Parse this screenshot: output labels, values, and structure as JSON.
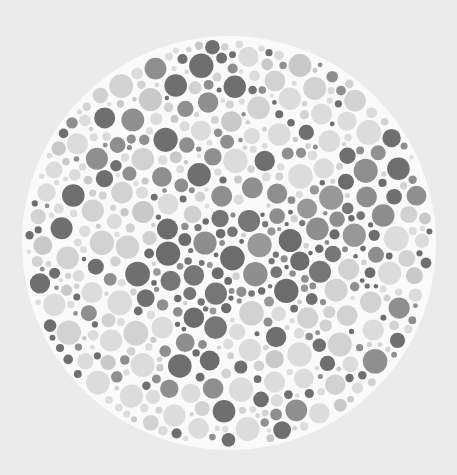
{
  "plate": {
    "title": "Color vision test plate",
    "hidden_figure": "animal silhouette",
    "background_color": "#ebebeb",
    "disc_color": "#fafafa",
    "center": [
      229,
      243
    ],
    "radius": 204,
    "seed": 20240611,
    "dot_count_target": 1400,
    "min_radius": 2.2,
    "max_radius": 12.5,
    "gap": 1.4,
    "field_palette": [
      "#dcdcdc",
      "#d2d2d2",
      "#c9c9c9",
      "#8f8f8f",
      "#6f6f6f"
    ],
    "field_weights": [
      0.34,
      0.2,
      0.1,
      0.2,
      0.16
    ],
    "figure_palette": [
      "#6c6c6c",
      "#767676",
      "#8e8e8e",
      "#989898",
      "#d0d0d0"
    ],
    "figure_weights": [
      0.38,
      0.2,
      0.22,
      0.1,
      0.1
    ],
    "figure_polygon": [
      [
        132,
        238
      ],
      [
        150,
        226
      ],
      [
        178,
        214
      ],
      [
        210,
        206
      ],
      [
        245,
        202
      ],
      [
        280,
        200
      ],
      [
        300,
        196
      ],
      [
        318,
        184
      ],
      [
        336,
        176
      ],
      [
        362,
        172
      ],
      [
        388,
        178
      ],
      [
        394,
        196
      ],
      [
        390,
        222
      ],
      [
        396,
        250
      ],
      [
        392,
        272
      ],
      [
        372,
        276
      ],
      [
        352,
        268
      ],
      [
        344,
        250
      ],
      [
        334,
        262
      ],
      [
        318,
        282
      ],
      [
        300,
        300
      ],
      [
        280,
        304
      ],
      [
        258,
        300
      ],
      [
        240,
        306
      ],
      [
        226,
        326
      ],
      [
        218,
        350
      ],
      [
        210,
        372
      ],
      [
        198,
        386
      ],
      [
        186,
        378
      ],
      [
        184,
        352
      ],
      [
        178,
        328
      ],
      [
        166,
        306
      ],
      [
        150,
        292
      ],
      [
        138,
        272
      ],
      [
        134,
        256
      ]
    ]
  }
}
